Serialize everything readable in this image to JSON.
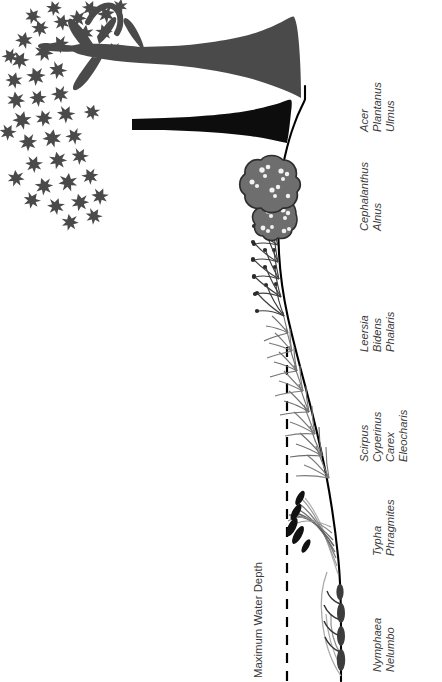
{
  "figure": {
    "orientation": "rotated-90-ccw",
    "background_color": "#ffffff",
    "ink_color": "#000000",
    "gray_fill": "#6e6e6e",
    "light_gray_line": "#9a9a9a",
    "text_color": "#3a3a3a"
  },
  "annotations": {
    "max_water_depth": "Maximum Water Depth"
  },
  "zones": [
    {
      "id": "floating-leaved",
      "genera": [
        "Nymphaea",
        "Nelumbo"
      ],
      "label_x": 382,
      "label_y": 598
    },
    {
      "id": "tall-emergent",
      "genera": [
        "Typha",
        "Phragmites"
      ],
      "label_x": 382,
      "label_y": 498
    },
    {
      "id": "sedge-meadow",
      "genera": [
        "Scirpus",
        "Cyperinus",
        "Carex",
        "Eleocharis"
      ],
      "label_x": 372,
      "label_y": 408
    },
    {
      "id": "wet-meadow-grass",
      "genera": [
        "Leersia",
        "Bidens",
        "Phalaris"
      ],
      "label_x": 382,
      "label_y": 303
    },
    {
      "id": "shrub-swamp",
      "genera": [
        "Cephalanthus",
        "Alnus"
      ],
      "label_x": 382,
      "label_y": 190
    },
    {
      "id": "bottomland-forest",
      "genera": [
        "Acer",
        "Plantanus",
        "Ulmus"
      ],
      "label_x": 382,
      "label_y": 95
    }
  ],
  "edge_caption": {
    "text": "",
    "visible": false
  }
}
